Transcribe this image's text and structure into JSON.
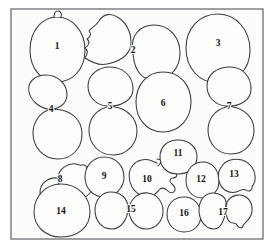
{
  "figure": {
    "background_color": "#ffffff",
    "frame": {
      "x": 11,
      "y": 9,
      "width": 252,
      "height": 230,
      "stroke_color": "#6e6e73",
      "fill_color": "#fcfcfb"
    },
    "outline_color": "#3a3a3a",
    "label_color": "#111111",
    "count": 17,
    "objects": [
      {
        "id": 1,
        "label": "1",
        "label_x": 57,
        "label_y": 47,
        "kind": "single-oval-with-nubs",
        "paths": [
          "M57,17 C72,17 85,31 85,50 C85,70 72,82 57,82 C42,82 30,69 30,50 C30,31 42,17 57,17 Z",
          "M54,17 C54,13 56,11 58,11 C61,11 62,14 61,17",
          "M55,82 C55,85 57,87 59,86 C61,85 61,83 60,82"
        ]
      },
      {
        "id": 2,
        "label": "2",
        "label_x": 133,
        "label_y": 51,
        "kind": "doublet-blob-and-circle",
        "paths": [
          "M130,49 C133,38 129,25 119,18 C111,12 103,14 99,21 C96,26 92,27 89,31 C92,34 90,37 87,39 C91,42 88,46 85,48 C89,51 87,55 85,58 C91,62 98,66 107,64 C117,62 126,58 130,49 Z",
          "M133,50 C130,36 140,25 154,25 C170,25 180,38 180,53 C180,69 169,80 154,80 C139,80 133,66 133,50 Z"
        ]
      },
      {
        "id": 3,
        "label": "3",
        "label_x": 218,
        "label_y": 44,
        "kind": "single-large-oval",
        "paths": [
          "M218,14 C236,14 250,30 250,50 C250,70 236,83 218,83 C199,83 186,68 186,48 C186,29 199,14 218,14 Z"
        ]
      },
      {
        "id": 4,
        "label": "4",
        "label_x": 51,
        "label_y": 110,
        "kind": "vertical-doublet",
        "paths": [
          "M48,109 C40,108 31,101 29,92 C27,82 35,75 46,75 C58,75 67,84 67,95 C67,104 58,110 48,109 Z",
          "M48,110 C40,113 33,122 33,133 C33,148 44,159 58,159 C72,159 82,148 82,134 C82,120 72,112 61,110 C56,109 52,109 48,110 Z"
        ]
      },
      {
        "id": 5,
        "label": "5",
        "label_x": 110,
        "label_y": 107,
        "kind": "vertical-doublet",
        "paths": [
          "M107,106 C96,105 88,97 88,86 C88,75 98,67 110,67 C124,67 133,77 133,89 C133,100 121,107 107,106 Z",
          "M107,107 C96,110 89,119 89,130 C89,144 99,155 113,155 C127,155 137,144 137,131 C137,118 127,109 115,107 C112,106 110,106 107,107 Z"
        ]
      },
      {
        "id": 6,
        "label": "6",
        "label_x": 163,
        "label_y": 104,
        "kind": "single-round",
        "paths": [
          "M163,72 C180,72 191,85 191,102 C191,119 179,132 163,132 C147,132 136,119 136,102 C136,85 147,72 163,72 Z"
        ]
      },
      {
        "id": 7,
        "label": "7",
        "label_x": 229,
        "label_y": 107,
        "kind": "vertical-doublet",
        "paths": [
          "M226,106 C215,105 207,97 207,86 C207,74 217,67 230,67 C243,67 251,77 251,89 C251,100 240,107 226,106 Z",
          "M226,107 C215,110 208,119 208,130 C208,144 218,154 231,154 C245,154 254,143 254,130 C254,117 244,109 233,107 C231,106 228,106 226,107 Z"
        ]
      },
      {
        "id": 8,
        "label": "8",
        "label_x": 60,
        "label_y": 180,
        "kind": "doublet-circle-and-blob",
        "paths": [
          "M57,178 C48,177 40,184 40,192 C40,201 48,208 57,207 C66,206 72,198 71,189 C70,182 64,178 57,178 Z",
          "M58,179 C58,171 64,165 72,164 C77,163 79,166 82,165 C85,164 86,167 88,168 C90,169 90,172 92,173 C94,175 93,178 94,181 C95,185 93,190 89,194 C84,199 77,202 70,201 C63,200 58,188 58,179 Z"
        ]
      },
      {
        "id": 9,
        "label": "9",
        "label_x": 104,
        "label_y": 177,
        "kind": "single-round",
        "paths": [
          "M104,157 C116,157 124,166 124,177 C124,188 115,197 104,197 C93,197 85,188 85,177 C85,166 93,157 104,157 Z"
        ]
      },
      {
        "id": 10,
        "label": "10",
        "label_x": 147,
        "label_y": 180,
        "kind": "circle-with-bumpy-lobe",
        "paths": [
          "M152,161 C145,158 137,160 133,165 C128,171 128,180 132,187 C136,194 144,198 151,196 C156,195 158,191 160,189 C163,187 166,189 168,191 C171,194 174,193 175,190 C176,187 173,185 171,183 C169,181 170,178 173,178 C176,178 178,176 176,173 C174,170 170,171 168,169 C166,167 167,164 164,163 C162,162 159,164 157,163 C155,162 154,162 152,161 Z",
          "M158,166 L163,160 L157,159"
        ]
      },
      {
        "id": 11,
        "label": "11",
        "label_x": 178,
        "label_y": 154,
        "kind": "single-round",
        "paths": [
          "M178,140 C189,140 197,147 197,157 C197,167 189,174 178,174 C167,174 160,167 160,157 C160,147 167,140 178,140 Z"
        ]
      },
      {
        "id": 12,
        "label": "12",
        "label_x": 201,
        "label_y": 180,
        "kind": "doublet-member-left",
        "paths": [
          "M203,162 C213,162 219,171 219,181 C219,191 212,198 202,198 C192,198 186,190 186,180 C186,170 193,162 203,162 Z"
        ]
      },
      {
        "id": 13,
        "label": "13",
        "label_x": 234,
        "label_y": 175,
        "kind": "doublet-member-right-irregular",
        "paths": [
          "M222,166 C226,160 234,158 242,160 C251,163 256,171 255,180 C255,184 252,185 252,188 C252,191 248,192 246,190 C243,188 240,191 236,192 C228,194 221,189 219,181 C217,175 219,170 222,166 Z"
        ]
      },
      {
        "id": 14,
        "label": "14",
        "label_x": 61,
        "label_y": 212,
        "kind": "single-large-round",
        "paths": [
          "M61,184 C78,184 90,197 90,212 C90,227 78,237 61,237 C45,237 34,226 34,212 C34,197 45,184 61,184 Z"
        ]
      },
      {
        "id": 15,
        "label": "15",
        "label_x": 131,
        "label_y": 210,
        "kind": "horizontal-doublet",
        "paths": [
          "M128,208 C128,198 120,192 111,192 C102,192 95,200 95,210 C95,221 102,229 112,229 C121,229 128,219 128,208 Z",
          "M129,208 C131,198 139,192 148,193 C157,194 163,202 163,211 C163,222 155,229 146,229 C136,229 128,219 129,208 Z"
        ]
      },
      {
        "id": 16,
        "label": "16",
        "label_x": 184,
        "label_y": 214,
        "kind": "single-round",
        "paths": [
          "M184,197 C194,197 201,205 201,215 C201,225 194,232 184,232 C174,232 167,224 167,214 C167,204 174,197 184,197 Z"
        ]
      },
      {
        "id": 17,
        "label": "17",
        "label_x": 223,
        "label_y": 213,
        "kind": "horizontal-doublet-with-bump",
        "paths": [
          "M226,203 C226,197 220,193 213,193 C205,193 199,200 199,210 C199,221 206,229 214,229 C221,229 226,219 226,203 Z",
          "M227,202 C231,195 240,193 246,197 C252,201 254,210 250,217 C248,221 244,223 243,226 C242,229 238,228 237,225 C236,222 232,224 230,222 C226,219 225,209 227,202 Z"
        ]
      }
    ]
  }
}
